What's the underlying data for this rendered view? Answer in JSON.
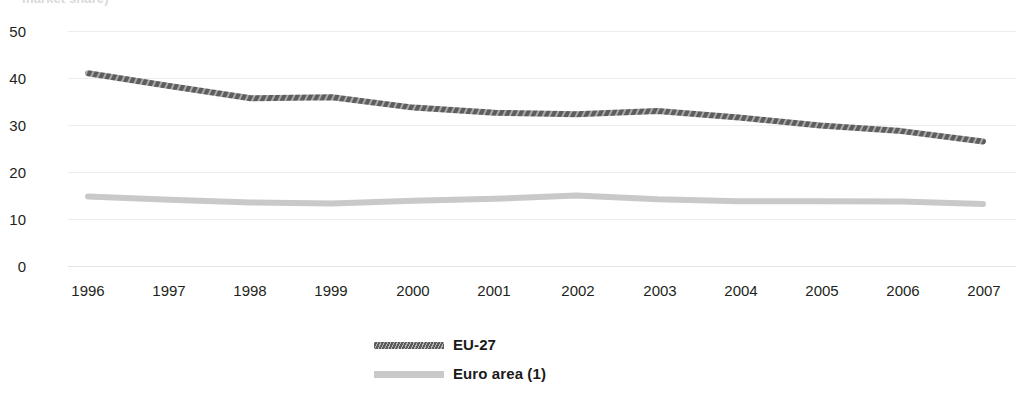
{
  "title_fragment": "market share)",
  "axes": {
    "y_ticks": [
      "50",
      "40",
      "30",
      "20",
      "10",
      "0"
    ],
    "x_ticks": [
      "1996",
      "1997",
      "1998",
      "1999",
      "2000",
      "2001",
      "2002",
      "2003",
      "2004",
      "2005",
      "2006",
      "2007"
    ]
  },
  "legend": {
    "items": [
      {
        "label": "EU-27",
        "color": "#5d5d5d",
        "icon": "hatched-line-swatch"
      },
      {
        "label": "Euro area (1)",
        "color": "#c9c9c9",
        "icon": "solid-line-swatch"
      }
    ]
  },
  "chart_data": {
    "type": "line",
    "title": "market share)",
    "xlabel": "",
    "ylabel": "",
    "ylim": [
      0,
      50
    ],
    "yticks": [
      0,
      10,
      20,
      30,
      40,
      50
    ],
    "grid": true,
    "legend_position": "bottom-center",
    "x": [
      1996,
      1997,
      1998,
      1999,
      2000,
      2001,
      2002,
      2003,
      2004,
      2005,
      2006,
      2007
    ],
    "categories": [
      "1996",
      "1997",
      "1998",
      "1999",
      "2000",
      "2001",
      "2002",
      "2003",
      "2004",
      "2005",
      "2006",
      "2007"
    ],
    "series": [
      {
        "name": "EU-27",
        "color": "#5d5d5d",
        "values": [
          41.0,
          38.3,
          35.7,
          35.9,
          33.7,
          32.6,
          32.3,
          33.0,
          31.6,
          29.9,
          28.7,
          26.5
        ]
      },
      {
        "name": "Euro area (1)",
        "color": "#c9c9c9",
        "values": [
          14.8,
          14.1,
          13.5,
          13.3,
          13.9,
          14.3,
          15.0,
          14.2,
          13.8,
          13.8,
          13.7,
          13.2
        ]
      }
    ]
  }
}
